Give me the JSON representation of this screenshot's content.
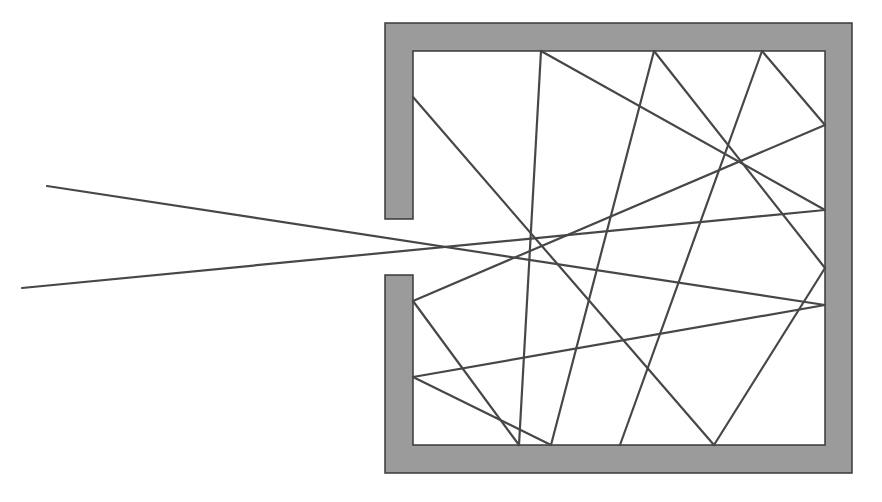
{
  "diagram": {
    "title": "Light ray trapped in a cavity with a small opening (blackbody cavity model)",
    "colors": {
      "background": "#ffffff",
      "wall_fill": "#9b9b9b",
      "wall_stroke": "#3a3a3a",
      "ray": "#474747"
    },
    "cavity": {
      "outer": {
        "left": 385,
        "top": 23,
        "right": 852,
        "bottom": 473
      },
      "inner": {
        "left": 413,
        "top": 51,
        "right": 825,
        "bottom": 445
      },
      "opening": {
        "top": 219,
        "bottom": 275
      }
    },
    "walls": [
      {
        "name": "wall-top",
        "points": "385,23 852,23 852,51 385,51"
      },
      {
        "name": "wall-right",
        "points": "825,23 852,23 852,473 825,473"
      },
      {
        "name": "wall-bottom",
        "points": "385,445 852,445 852,473 385,473"
      },
      {
        "name": "wall-left-upper",
        "points": "385,23 413,23 413,219 385,219"
      },
      {
        "name": "wall-left-lower",
        "points": "385,275 413,275 413,473 385,473"
      }
    ],
    "rays": [
      {
        "name": "incoming-ray-upper",
        "x1": 47,
        "y1": 186,
        "x2": 825,
        "y2": 305
      },
      {
        "name": "incoming-ray-lower",
        "x1": 22,
        "y1": 288,
        "x2": 825,
        "y2": 210
      },
      {
        "name": "reflection",
        "x1": 825,
        "y1": 210,
        "x2": 541,
        "y2": 51
      },
      {
        "name": "reflection",
        "x1": 541,
        "y1": 51,
        "x2": 519,
        "y2": 445
      },
      {
        "name": "reflection",
        "x1": 519,
        "y1": 445,
        "x2": 413,
        "y2": 301
      },
      {
        "name": "reflection",
        "x1": 413,
        "y1": 301,
        "x2": 825,
        "y2": 125
      },
      {
        "name": "reflection",
        "x1": 825,
        "y1": 125,
        "x2": 762,
        "y2": 51
      },
      {
        "name": "reflection",
        "x1": 762,
        "y1": 51,
        "x2": 620,
        "y2": 445
      },
      {
        "name": "reflection",
        "x1": 551,
        "y1": 445,
        "x2": 654,
        "y2": 51
      },
      {
        "name": "reflection",
        "x1": 654,
        "y1": 51,
        "x2": 825,
        "y2": 268
      },
      {
        "name": "reflection",
        "x1": 825,
        "y1": 268,
        "x2": 714,
        "y2": 445
      },
      {
        "name": "reflection",
        "x1": 714,
        "y1": 445,
        "x2": 413,
        "y2": 97
      },
      {
        "name": "reflection",
        "x1": 825,
        "y1": 305,
        "x2": 413,
        "y2": 377
      },
      {
        "name": "reflection",
        "x1": 413,
        "y1": 377,
        "x2": 551,
        "y2": 445
      }
    ]
  }
}
